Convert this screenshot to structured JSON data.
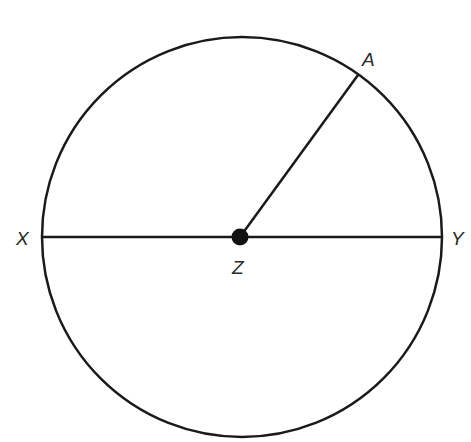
{
  "diagram": {
    "type": "circle-geometry",
    "stroke_color": "#1a1a1a",
    "background": "#ffffff",
    "circle": {
      "cx": 242,
      "cy": 237,
      "r": 200
    },
    "center": {
      "label": "Z",
      "x": 240,
      "y": 237,
      "dot_radius": 8
    },
    "points": [
      {
        "id": "X",
        "label": "X",
        "x": 43,
        "y": 237
      },
      {
        "id": "Y",
        "label": "Y",
        "x": 442,
        "y": 237
      },
      {
        "id": "A",
        "label": "A",
        "x": 358,
        "y": 75
      }
    ],
    "segments": [
      {
        "from": "X",
        "to": "Y",
        "name": "diameter-XY"
      },
      {
        "from": "Z",
        "to": "A",
        "name": "radius-ZA"
      }
    ],
    "labels": {
      "X": "X",
      "Y": "Y",
      "Z": "Z",
      "A": "A"
    }
  }
}
